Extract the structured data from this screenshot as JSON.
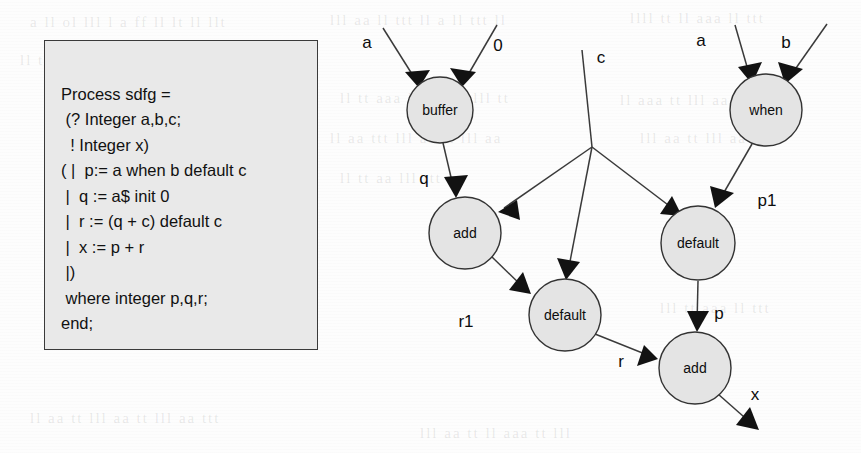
{
  "page": {
    "background_color": "#fdfdfd",
    "width": 861,
    "height": 453
  },
  "code_box": {
    "fill_color": "#e9e9e9",
    "border_color": "#3a3a3a",
    "code": "Process sdfg =\n (? Integer a,b,c;\n  ! Integer x)\n( |  p:= a when b default c\n |  q := a$ init 0\n |  r := (q + c) default c\n |  x := p + r\n |)\n where integer p,q,r;\nend;"
  },
  "diagram": {
    "node_fill": "#e4e4e4",
    "node_stroke": "#333333",
    "edge_stroke": "#3a3a3a",
    "nodes": [
      {
        "id": "buffer",
        "label": "buffer",
        "cx": 440,
        "cy": 110,
        "r": 33
      },
      {
        "id": "when",
        "label": "when",
        "cx": 766,
        "cy": 110,
        "r": 36
      },
      {
        "id": "add1",
        "label": "add",
        "cx": 465,
        "cy": 233,
        "r": 36
      },
      {
        "id": "default1",
        "label": "default",
        "cx": 698,
        "cy": 243,
        "r": 37
      },
      {
        "id": "default2",
        "label": "default",
        "cx": 565,
        "cy": 315,
        "r": 36
      },
      {
        "id": "add2",
        "label": "add",
        "cx": 695,
        "cy": 368,
        "r": 36
      }
    ],
    "edge_labels": [
      {
        "id": "in-a-buffer",
        "text": "a",
        "x": 367,
        "y": 42
      },
      {
        "id": "in-zero",
        "text": "0",
        "x": 498,
        "y": 45
      },
      {
        "id": "in-c",
        "text": "c",
        "x": 601,
        "y": 57
      },
      {
        "id": "in-a-when",
        "text": "a",
        "x": 701,
        "y": 40
      },
      {
        "id": "in-b-when",
        "text": "b",
        "x": 786,
        "y": 42
      },
      {
        "id": "edge-q",
        "text": "q",
        "x": 424,
        "y": 178
      },
      {
        "id": "edge-p1",
        "text": "p1",
        "x": 767,
        "y": 200
      },
      {
        "id": "edge-r1",
        "text": "r1",
        "x": 466,
        "y": 321
      },
      {
        "id": "edge-p",
        "text": "p",
        "x": 719,
        "y": 313
      },
      {
        "id": "edge-r",
        "text": "r",
        "x": 621,
        "y": 361
      },
      {
        "id": "out-x",
        "text": "x",
        "x": 755,
        "y": 394
      }
    ]
  },
  "ghost_text": [
    {
      "text": "a  ll  ol  lll  l  a  ff  ll  lt  ll  llt",
      "x": 30,
      "y": 14
    },
    {
      "text": "lll  aa  ll  ttt  ll  a  ll  ttt  ll",
      "x": 330,
      "y": 12
    },
    {
      "text": "llll  tt  ll  aaa  ll  ttt",
      "x": 630,
      "y": 10
    },
    {
      "text": "ll  tt  aaa  ll  tt  lll  aa  ttt  lll",
      "x": 20,
      "y": 52
    },
    {
      "text": "ll  tt  aaa  lll  tt  aa  lll  tt",
      "x": 340,
      "y": 90
    },
    {
      "text": "ll  aaa  tt  lll  aa  tt  lll",
      "x": 620,
      "y": 92
    },
    {
      "text": "ll  aa  ttt  lll  aa  tt  lll  aa",
      "x": 330,
      "y": 130
    },
    {
      "text": "lll  aa  tt  lll  aa  tt",
      "x": 640,
      "y": 130
    },
    {
      "text": "ll  tt  aa  lll  ttt  aa",
      "x": 340,
      "y": 170
    },
    {
      "text": "lll  tt  aaa  ll  ttt",
      "x": 660,
      "y": 300
    },
    {
      "text": "ll  aa  tt  lll  aa  tt  lll  aa  ttt",
      "x": 30,
      "y": 410
    },
    {
      "text": "lll  aa  tt  ll  aaa  tt  lll",
      "x": 420,
      "y": 425
    }
  ]
}
